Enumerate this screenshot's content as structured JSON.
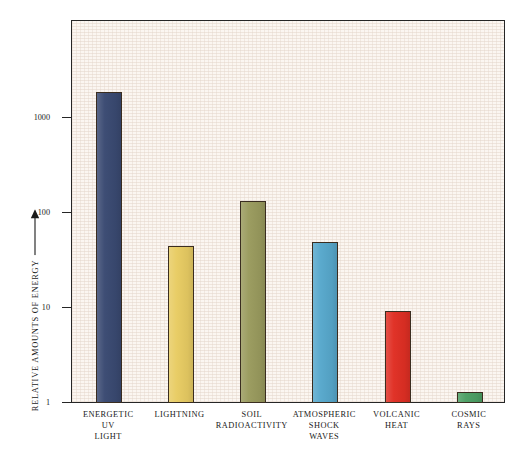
{
  "chart_data": {
    "type": "bar",
    "title": "",
    "subtitle": "",
    "xlabel": "",
    "ylabel": "RELATIVE AMOUNTS OF ENERGY",
    "ylabel_arrow": "up-arrow",
    "yscale": "log",
    "ylim": [
      1,
      4000
    ],
    "ytick_labels": [
      "1000",
      "100",
      "10",
      "1"
    ],
    "ytick_values": [
      1000,
      100,
      10,
      1
    ],
    "grid": false,
    "legend": "none",
    "categories": [
      "ENERGETIC UV LIGHT",
      "LIGHTNING",
      "SOIL RADIOACTIVITY",
      "ATMOSPHERIC SHOCK WAVES",
      "VOLCANIC HEAT",
      "COSMIC RAYS"
    ],
    "category_lines": [
      [
        "ENERGETIC",
        "UV",
        "LIGHT"
      ],
      [
        "LIGHTNING"
      ],
      [
        "SOIL",
        "RADIOACTIVITY"
      ],
      [
        "ATMOSPHERIC",
        "SHOCK",
        "WAVES"
      ],
      [
        "VOLCANIC",
        "HEAT"
      ],
      [
        "COSMIC",
        "RAYS"
      ]
    ],
    "values": [
      1870,
      45,
      134,
      50,
      9.3,
      1.3
    ],
    "bar_colors": [
      "#3a4a72",
      "#e8cc63",
      "#9a9b5e",
      "#57a8cc",
      "#e02f24",
      "#4da065"
    ],
    "plot_background": "#f8f2ec",
    "frame_color": "#262626",
    "text_color": "#1a1a1a"
  }
}
